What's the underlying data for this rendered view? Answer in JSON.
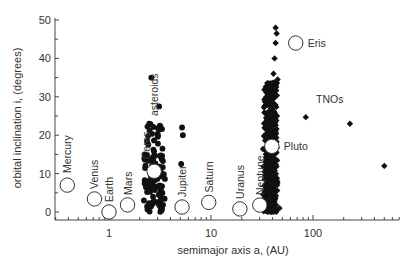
{
  "chart_data": {
    "type": "scatter",
    "title": "",
    "xlabel": "semimajor axis a, (AU)",
    "ylabel": "orbital inclination i, (degrees)",
    "xscale": "log",
    "xlim": [
      0.3,
      700
    ],
    "ylim": [
      -2,
      50
    ],
    "xticks": [
      1,
      10,
      100
    ],
    "xtick_labels": [
      "1",
      "10",
      "100"
    ],
    "yticks": [
      0,
      10,
      20,
      30,
      40,
      50
    ],
    "ytick_labels": [
      "0",
      "10",
      "20",
      "30",
      "40",
      "50"
    ],
    "grid": false,
    "legend": null,
    "series": [
      {
        "name": "planets and dwarf planets",
        "marker": "open-circle",
        "points": [
          {
            "label": "Mercury",
            "a": 0.39,
            "i": 7.0
          },
          {
            "label": "Venus",
            "a": 0.72,
            "i": 3.4
          },
          {
            "label": "Earth",
            "a": 1.0,
            "i": 0.0
          },
          {
            "label": "Mars",
            "a": 1.52,
            "i": 1.85
          },
          {
            "label": "Ceres",
            "a": 2.77,
            "i": 10.6
          },
          {
            "label": "Jupiter",
            "a": 5.2,
            "i": 1.3
          },
          {
            "label": "Saturn",
            "a": 9.5,
            "i": 2.5
          },
          {
            "label": "Uranus",
            "a": 19.2,
            "i": 0.8
          },
          {
            "label": "Neptune",
            "a": 30.1,
            "i": 1.8
          },
          {
            "label": "Pluto",
            "a": 39.5,
            "i": 17.1
          },
          {
            "label": "Eris",
            "a": 67.7,
            "i": 44.0
          }
        ]
      },
      {
        "name": "asteroids",
        "marker": "filled-circle",
        "range_a": [
          2.1,
          5.5
        ],
        "range_i": [
          1,
          35
        ],
        "cluster_center_a": 2.8
      },
      {
        "name": "TNOs",
        "marker": "filled-diamond",
        "range_a": [
          30,
          50
        ],
        "range_i": [
          0,
          48
        ],
        "outliers": [
          {
            "a": 85,
            "i": 24.7
          },
          {
            "a": 230,
            "i": 23.0
          },
          {
            "a": 500,
            "i": 12.0
          }
        ]
      }
    ],
    "annotations": [
      "asteroids",
      "TNOs"
    ]
  },
  "labels": {
    "asteroids": "asteroids",
    "tnos": "TNOs"
  }
}
